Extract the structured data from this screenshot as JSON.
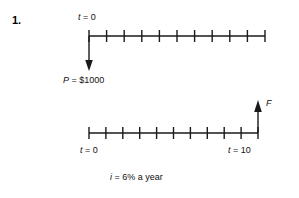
{
  "problem": {
    "number": "1."
  },
  "labels": {
    "t_zero_top": "t = 0",
    "present_value": "P = $1000",
    "future_value": "F",
    "t_zero_bottom": "t = 0",
    "t_ten_bottom": "t = 10",
    "interest_rate": "i = 6% a year"
  },
  "style": {
    "line_color": "#1a1a1a",
    "text_color": "#111111",
    "background": "#ffffff"
  },
  "chart_data": {
    "type": "diagram",
    "timelines": [
      {
        "name": "present-worth-timeline",
        "periods": 10,
        "x_start": 89,
        "x_end": 265,
        "y": 36,
        "start_label": "t = 0",
        "end_label": "",
        "tick_values": [
          0,
          1,
          2,
          3,
          4,
          5,
          6,
          7,
          8,
          9,
          10
        ],
        "arrow": {
          "name": "present-value-arrow",
          "direction": "down",
          "at_period": 0,
          "label": "P = $1000",
          "value": 1000,
          "currency": "$"
        }
      },
      {
        "name": "future-worth-timeline",
        "periods": 10,
        "x_start": 89,
        "x_end": 265,
        "y": 133,
        "start_label": "t = 0",
        "end_label": "t = 10",
        "tick_values": [
          0,
          1,
          2,
          3,
          4,
          5,
          6,
          7,
          8,
          9,
          10
        ],
        "arrow": {
          "name": "future-value-arrow",
          "direction": "up",
          "at_period": 10,
          "label": "F",
          "value": null,
          "currency": "$"
        }
      }
    ],
    "annotations": [
      {
        "name": "interest-rate-note",
        "text": "i = 6% a year",
        "interest_percent": 6,
        "period": "year"
      }
    ]
  }
}
